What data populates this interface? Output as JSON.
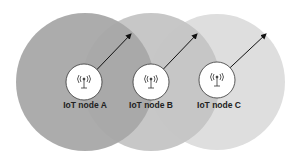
{
  "nodes": [
    {
      "label": "IoT node A",
      "icon": "antenna-icon",
      "cx": 85,
      "cy": 82,
      "r": 69,
      "fill": "#a9a9a9"
    },
    {
      "label": "IoT node B",
      "icon": "antenna-icon",
      "cx": 151,
      "cy": 82,
      "r": 69,
      "fill": "#c6c6c6"
    },
    {
      "label": "IoT node C",
      "icon": "antenna-icon",
      "cx": 217,
      "cy": 82,
      "r": 68,
      "fill": "#dddddd"
    }
  ]
}
